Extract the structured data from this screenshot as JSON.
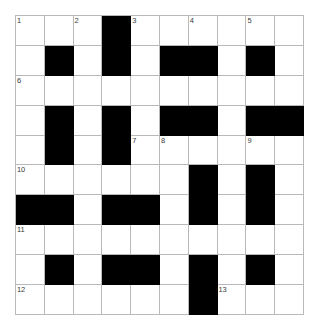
{
  "puzzle": {
    "type": "crossword-grid",
    "columns": 10,
    "rows": 10,
    "cell_size_px": 29,
    "colors": {
      "background": "#ffffff",
      "grid_line": "#b9b9b9",
      "block": "#000000",
      "number_text": "#3a3a3a"
    },
    "blocks": [
      [
        0,
        3
      ],
      [
        1,
        1
      ],
      [
        1,
        3
      ],
      [
        1,
        5
      ],
      [
        1,
        6
      ],
      [
        1,
        8
      ],
      [
        3,
        1
      ],
      [
        3,
        3
      ],
      [
        3,
        5
      ],
      [
        3,
        6
      ],
      [
        3,
        8
      ],
      [
        3,
        9
      ],
      [
        4,
        1
      ],
      [
        4,
        3
      ],
      [
        5,
        6
      ],
      [
        5,
        8
      ],
      [
        6,
        0
      ],
      [
        6,
        1
      ],
      [
        6,
        3
      ],
      [
        6,
        4
      ],
      [
        6,
        6
      ],
      [
        6,
        8
      ],
      [
        8,
        1
      ],
      [
        8,
        3
      ],
      [
        8,
        4
      ],
      [
        8,
        6
      ],
      [
        8,
        8
      ],
      [
        9,
        6
      ]
    ],
    "numbers": [
      {
        "label": "1",
        "row": 0,
        "col": 0
      },
      {
        "label": "2",
        "row": 0,
        "col": 2
      },
      {
        "label": "3",
        "row": 0,
        "col": 4
      },
      {
        "label": "4",
        "row": 0,
        "col": 6
      },
      {
        "label": "5",
        "row": 0,
        "col": 8
      },
      {
        "label": "6",
        "row": 2,
        "col": 0
      },
      {
        "label": "7",
        "row": 4,
        "col": 4
      },
      {
        "label": "8",
        "row": 4,
        "col": 5
      },
      {
        "label": "9",
        "row": 4,
        "col": 8
      },
      {
        "label": "10",
        "row": 5,
        "col": 0
      },
      {
        "label": "11",
        "row": 7,
        "col": 0
      },
      {
        "label": "12",
        "row": 9,
        "col": 0
      },
      {
        "label": "13",
        "row": 9,
        "col": 7
      }
    ],
    "letters": []
  }
}
